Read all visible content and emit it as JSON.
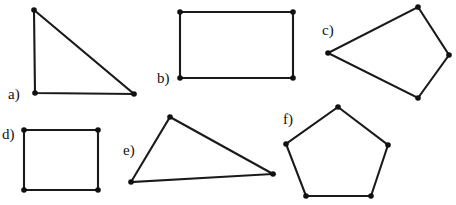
{
  "figure": {
    "width": 456,
    "height": 205,
    "background_color": "#ffffff",
    "stroke_color": "#1a1a1a",
    "vertex_color": "#111111",
    "stroke_width": 2.1,
    "vertex_radius": 2.8
  },
  "shapes": [
    {
      "id": "a",
      "label": "a)",
      "name": "right-triangle",
      "sides": 3,
      "label_x": 8,
      "label_y": 99,
      "points": "34,10 35,93 134,94",
      "vertices": [
        {
          "x": 34,
          "y": 10
        },
        {
          "x": 35,
          "y": 93
        },
        {
          "x": 134,
          "y": 94
        }
      ]
    },
    {
      "id": "b",
      "label": "b)",
      "name": "rectangle",
      "sides": 4,
      "label_x": 157,
      "label_y": 83,
      "points": "180,12 293,12 293,78 180,78",
      "vertices": [
        {
          "x": 180,
          "y": 12
        },
        {
          "x": 293,
          "y": 12
        },
        {
          "x": 293,
          "y": 78
        },
        {
          "x": 180,
          "y": 78
        }
      ]
    },
    {
      "id": "c",
      "label": "c)",
      "name": "irregular-quadrilateral",
      "sides": 4,
      "label_x": 322,
      "label_y": 35,
      "points": "418,7 449,55 418,98 328,53",
      "vertices": [
        {
          "x": 418,
          "y": 7
        },
        {
          "x": 449,
          "y": 55
        },
        {
          "x": 418,
          "y": 98
        },
        {
          "x": 328,
          "y": 53
        }
      ]
    },
    {
      "id": "d",
      "label": "d)",
      "name": "square",
      "sides": 4,
      "label_x": 2,
      "label_y": 139,
      "points": "24,130 98,130 98,190 24,190",
      "vertices": [
        {
          "x": 24,
          "y": 130
        },
        {
          "x": 98,
          "y": 130
        },
        {
          "x": 98,
          "y": 190
        },
        {
          "x": 24,
          "y": 190
        }
      ]
    },
    {
      "id": "e",
      "label": "e)",
      "name": "obtuse-triangle",
      "sides": 3,
      "label_x": 123,
      "label_y": 155,
      "points": "170,117 273,174 131,182",
      "vertices": [
        {
          "x": 170,
          "y": 117
        },
        {
          "x": 273,
          "y": 174
        },
        {
          "x": 131,
          "y": 182
        }
      ]
    },
    {
      "id": "f",
      "label": "f)",
      "name": "pentagon",
      "sides": 5,
      "label_x": 283,
      "label_y": 124,
      "points": "338,107 388,145 371,196 306,196 286,144",
      "vertices": [
        {
          "x": 338,
          "y": 107
        },
        {
          "x": 388,
          "y": 145
        },
        {
          "x": 371,
          "y": 196
        },
        {
          "x": 306,
          "y": 196
        },
        {
          "x": 286,
          "y": 144
        }
      ]
    }
  ]
}
